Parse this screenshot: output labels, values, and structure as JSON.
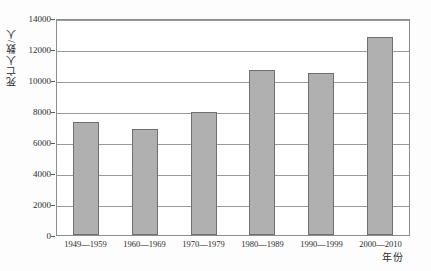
{
  "figure": {
    "top_strip_text": "",
    "background_color": "#fdfdfd"
  },
  "colors": {
    "bar_fill": "#b0b0b0",
    "bar_border": "#6f6f6f",
    "gridline": "#9a9a9a",
    "frame": "#8c8c8c",
    "text": "#2b2b2b"
  },
  "chart_data": {
    "type": "bar",
    "title": "",
    "xlabel": "年份",
    "ylabel": "死亡人数/人",
    "categories": [
      "1949—1959",
      "1960—1969",
      "1970—1979",
      "1980—1989",
      "1990—1999",
      "2000—2010"
    ],
    "values": [
      7300,
      6850,
      7950,
      10650,
      10450,
      12800
    ],
    "ylim": [
      0,
      14000
    ],
    "yticks": [
      0,
      2000,
      4000,
      6000,
      8000,
      10000,
      12000,
      14000
    ],
    "ytick_labels": [
      "0",
      "2000",
      "4000",
      "6000",
      "8000",
      "10000",
      "12000",
      "14000"
    ],
    "grid": true,
    "legend": null,
    "orientation": "vertical"
  }
}
